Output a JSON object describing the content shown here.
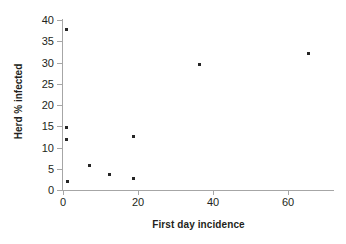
{
  "chart_data": {
    "type": "scatter",
    "title": "",
    "xlabel": "First day incidence",
    "ylabel": "Herd % infected",
    "xlim": [
      0,
      72
    ],
    "ylim": [
      0,
      40
    ],
    "xticks": [
      0,
      20,
      40,
      60
    ],
    "yticks": [
      0,
      5,
      10,
      15,
      20,
      25,
      30,
      35,
      40
    ],
    "xtick_labels": [
      "0",
      "20",
      "40",
      "60"
    ],
    "ytick_labels": [
      "0",
      "5",
      "10",
      "15",
      "20",
      "25",
      "30",
      "35",
      "40"
    ],
    "grid": false,
    "legend": null,
    "marker": {
      "shape": "square",
      "color": "#262626",
      "size": 3
    },
    "axis_color": "#a6a6a6",
    "background": "#ffffff",
    "points": [
      {
        "x": 1.0,
        "y": 37.8
      },
      {
        "x": 1.0,
        "y": 14.7
      },
      {
        "x": 1.0,
        "y": 11.8
      },
      {
        "x": 1.2,
        "y": 1.9
      },
      {
        "x": 7.0,
        "y": 5.7
      },
      {
        "x": 12.5,
        "y": 3.7
      },
      {
        "x": 18.8,
        "y": 12.7
      },
      {
        "x": 18.8,
        "y": 2.7
      },
      {
        "x": 36.5,
        "y": 29.5
      },
      {
        "x": 65.5,
        "y": 32.2
      }
    ]
  }
}
